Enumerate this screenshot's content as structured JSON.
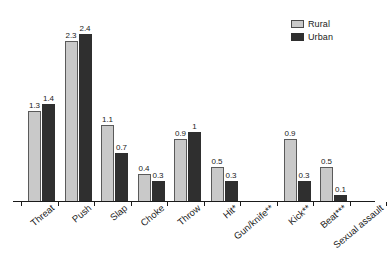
{
  "chart_data": {
    "type": "bar",
    "title": "",
    "subtitle": "",
    "xlabel": "",
    "ylabel": "",
    "ylim": [
      0,
      2.6
    ],
    "grid": false,
    "legend_position": "top-right",
    "orientation": "vertical",
    "grouping": "grouped",
    "categories": [
      "Threat",
      "Push",
      "Slap",
      "Choke",
      "Throw",
      "Hit*",
      "Gun/knife**",
      "Kick**",
      "Beat***",
      "Sexual assault"
    ],
    "series": [
      {
        "name": "Rural",
        "color": "#c9c9c9",
        "values": [
          1.3,
          2.3,
          1.1,
          0.4,
          0.9,
          0.5,
          0,
          0.9,
          0.5,
          0
        ],
        "labels": [
          "1.3",
          "2.3",
          "1.1",
          "0.4",
          "0.9",
          "0.5",
          "",
          "0.9",
          "0.5",
          ""
        ]
      },
      {
        "name": "Urban",
        "color": "#2f2f2f",
        "values": [
          1.4,
          2.4,
          0.7,
          0.3,
          1,
          0.3,
          0,
          0.3,
          0.1,
          0
        ],
        "labels": [
          "1.4",
          "2.4",
          "0.7",
          "0.3",
          "1",
          "0.3",
          "",
          "0.3",
          "0.1",
          ""
        ]
      }
    ],
    "tick_labels": [],
    "annotations": []
  },
  "legend": {
    "items": [
      {
        "label": "Rural",
        "swatch": "rural-swatch"
      },
      {
        "label": "Urban",
        "swatch": "urban-swatch"
      }
    ]
  }
}
